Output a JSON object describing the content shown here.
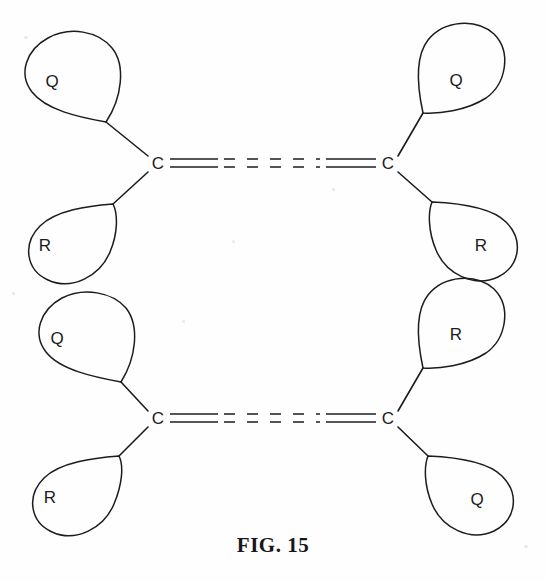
{
  "figure": {
    "caption": "FIG. 15",
    "caption_x": 0,
    "caption_y": 533,
    "background_color": "#fefefe",
    "ink_color": "#1c1c1c",
    "width": 546,
    "height": 581
  },
  "structures": [
    {
      "id": "upper-structure",
      "name": "cis-isomer",
      "left_atom": "C",
      "right_atom": "C",
      "left_atom_x": 158,
      "left_atom_y": 163,
      "right_atom_x": 388,
      "right_atom_y": 163,
      "bond_type": "double-bond-partial-dashed",
      "substituents": [
        {
          "position": "upper-left",
          "label": "Q",
          "label_x": 52,
          "label_y": 81
        },
        {
          "position": "lower-left",
          "label": "R",
          "label_x": 45,
          "label_y": 245
        },
        {
          "position": "upper-right",
          "label": "Q",
          "label_x": 456,
          "label_y": 80
        },
        {
          "position": "lower-right",
          "label": "R",
          "label_x": 481,
          "label_y": 245
        }
      ]
    },
    {
      "id": "lower-structure",
      "name": "trans-isomer",
      "left_atom": "C",
      "right_atom": "C",
      "left_atom_x": 158,
      "left_atom_y": 418,
      "right_atom_x": 388,
      "right_atom_y": 418,
      "bond_type": "double-bond-partial-dashed",
      "substituents": [
        {
          "position": "upper-left",
          "label": "Q",
          "label_x": 57,
          "label_y": 338
        },
        {
          "position": "lower-left",
          "label": "R",
          "label_x": 50,
          "label_y": 497
        },
        {
          "position": "upper-right",
          "label": "R",
          "label_x": 456,
          "label_y": 334
        },
        {
          "position": "lower-right",
          "label": "Q",
          "label_x": 477,
          "label_y": 499
        }
      ]
    }
  ],
  "bond_geometry": {
    "upper_line_offset": -4,
    "lower_line_offset": 4,
    "left_solid_start_x": 170,
    "left_solid_end_x": 218,
    "dashed_start_x": 224,
    "dashed_end_x": 318,
    "right_solid_start_x": 326,
    "right_solid_end_x": 376
  }
}
